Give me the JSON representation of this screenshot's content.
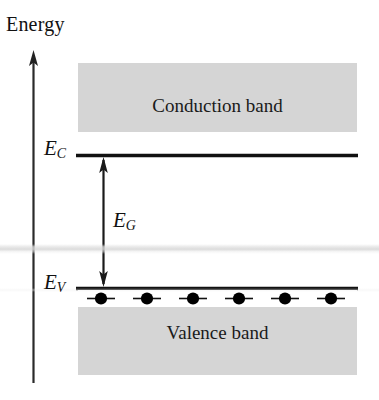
{
  "figure": {
    "background_color": "#ffffff"
  },
  "axis": {
    "label": "Energy",
    "direction": "up",
    "color": "#222222"
  },
  "bands": {
    "conduction": {
      "label": "Conduction band",
      "fill_color": "#d8d8d8",
      "state": "empty"
    },
    "valence": {
      "label": "Valence band",
      "fill_color": "#d8d8d8",
      "state": "filled"
    }
  },
  "levels": {
    "conduction_edge": {
      "symbol": "E",
      "subscript": "C",
      "line_color": "#111111"
    },
    "valence_edge": {
      "symbol": "E",
      "subscript": "V",
      "line_color": "#111111"
    }
  },
  "gap": {
    "symbol": "E",
    "subscript": "G",
    "arrow_style": "double-headed",
    "arrow_color": "#1a1a1a"
  },
  "electrons": {
    "count": 6,
    "color": "#000000",
    "marker": "filled-circle-with-bar"
  }
}
